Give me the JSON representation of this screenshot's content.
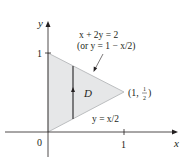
{
  "figure": {
    "type": "region-diagram",
    "axes": {
      "x_label": "x",
      "y_label": "y",
      "origin_label": "0",
      "x_tick_label": "1",
      "y_tick_label": "1"
    },
    "region": {
      "name": "D",
      "vertices": [
        [
          0,
          0
        ],
        [
          0,
          1
        ],
        [
          1,
          0.5
        ]
      ],
      "fill_color": "#e6e7e8",
      "edge_color": "#bcbec0"
    },
    "upper_boundary": {
      "equation": "x + 2y = 2",
      "alternate_form": "(or y = 1 − x/2)"
    },
    "lower_boundary": {
      "equation": "y = x/2"
    },
    "vertex_label": {
      "open": "(1, ",
      "numerator": "1",
      "denominator": "2",
      "close": ")"
    },
    "vertical_strip_x": 0.33,
    "colors": {
      "axis": "#231f20",
      "strip": "#414042",
      "text": "#231f20"
    }
  }
}
